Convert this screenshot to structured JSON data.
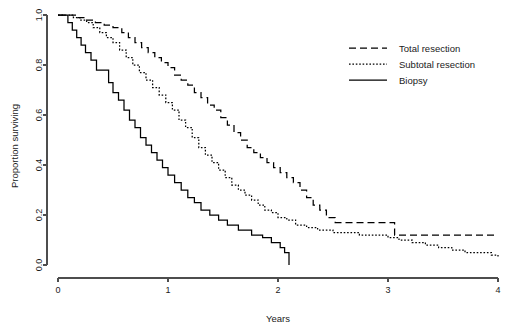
{
  "chart_data": {
    "type": "line",
    "title": "",
    "xlabel": "Years",
    "ylabel": "Proportion surviving",
    "xlim": [
      0,
      4
    ],
    "ylim": [
      0.0,
      1.0
    ],
    "xticks": [
      0,
      1,
      2,
      3,
      4
    ],
    "xtick_labels": [
      "0",
      "1",
      "2",
      "3",
      "4"
    ],
    "yticks": [
      0.0,
      0.2,
      0.4,
      0.6,
      0.8,
      1.0
    ],
    "ytick_labels": [
      "0.0",
      "0.2",
      "0.4",
      "0.6",
      "0.8",
      "1.0"
    ],
    "grid": false,
    "legend_position": "top-right",
    "step_type": "post",
    "series": [
      {
        "name": "Total resection",
        "line_style": "dashed",
        "color": "#000000",
        "dash_pattern": "7,4",
        "points": [
          [
            0.0,
            1.0
          ],
          [
            0.12,
            1.0
          ],
          [
            0.18,
            0.99
          ],
          [
            0.26,
            0.98
          ],
          [
            0.34,
            0.97
          ],
          [
            0.42,
            0.96
          ],
          [
            0.5,
            0.95
          ],
          [
            0.58,
            0.93
          ],
          [
            0.64,
            0.91
          ],
          [
            0.7,
            0.89
          ],
          [
            0.76,
            0.87
          ],
          [
            0.82,
            0.85
          ],
          [
            0.88,
            0.83
          ],
          [
            0.94,
            0.81
          ],
          [
            1.0,
            0.79
          ],
          [
            1.06,
            0.76
          ],
          [
            1.12,
            0.74
          ],
          [
            1.18,
            0.72
          ],
          [
            1.24,
            0.69
          ],
          [
            1.3,
            0.67
          ],
          [
            1.36,
            0.64
          ],
          [
            1.42,
            0.62
          ],
          [
            1.48,
            0.59
          ],
          [
            1.54,
            0.56
          ],
          [
            1.6,
            0.53
          ],
          [
            1.66,
            0.5
          ],
          [
            1.72,
            0.47
          ],
          [
            1.78,
            0.45
          ],
          [
            1.84,
            0.43
          ],
          [
            1.9,
            0.41
          ],
          [
            1.96,
            0.39
          ],
          [
            2.02,
            0.37
          ],
          [
            2.08,
            0.35
          ],
          [
            2.14,
            0.33
          ],
          [
            2.2,
            0.3
          ],
          [
            2.26,
            0.27
          ],
          [
            2.32,
            0.24
          ],
          [
            2.38,
            0.22
          ],
          [
            2.44,
            0.19
          ],
          [
            2.52,
            0.17
          ],
          [
            3.02,
            0.17
          ],
          [
            3.06,
            0.12
          ],
          [
            4.0,
            0.12
          ]
        ]
      },
      {
        "name": "Subtotal resection",
        "line_style": "dotted",
        "color": "#000000",
        "dash_pattern": "1.6,1.8",
        "points": [
          [
            0.0,
            1.0
          ],
          [
            0.08,
            1.0
          ],
          [
            0.14,
            0.99
          ],
          [
            0.2,
            0.98
          ],
          [
            0.26,
            0.97
          ],
          [
            0.32,
            0.95
          ],
          [
            0.38,
            0.93
          ],
          [
            0.44,
            0.91
          ],
          [
            0.5,
            0.89
          ],
          [
            0.56,
            0.86
          ],
          [
            0.62,
            0.83
          ],
          [
            0.68,
            0.8
          ],
          [
            0.74,
            0.77
          ],
          [
            0.8,
            0.74
          ],
          [
            0.86,
            0.71
          ],
          [
            0.92,
            0.68
          ],
          [
            0.98,
            0.65
          ],
          [
            1.04,
            0.62
          ],
          [
            1.1,
            0.58
          ],
          [
            1.16,
            0.55
          ],
          [
            1.22,
            0.51
          ],
          [
            1.28,
            0.47
          ],
          [
            1.34,
            0.44
          ],
          [
            1.4,
            0.41
          ],
          [
            1.46,
            0.38
          ],
          [
            1.52,
            0.35
          ],
          [
            1.58,
            0.32
          ],
          [
            1.64,
            0.3
          ],
          [
            1.7,
            0.28
          ],
          [
            1.76,
            0.26
          ],
          [
            1.82,
            0.24
          ],
          [
            1.88,
            0.22
          ],
          [
            1.94,
            0.21
          ],
          [
            2.0,
            0.19
          ],
          [
            2.08,
            0.18
          ],
          [
            2.16,
            0.16
          ],
          [
            2.26,
            0.15
          ],
          [
            2.36,
            0.14
          ],
          [
            2.5,
            0.13
          ],
          [
            2.62,
            0.13
          ],
          [
            2.74,
            0.12
          ],
          [
            2.88,
            0.12
          ],
          [
            3.0,
            0.11
          ],
          [
            3.1,
            0.1
          ],
          [
            3.22,
            0.09
          ],
          [
            3.34,
            0.08
          ],
          [
            3.46,
            0.07
          ],
          [
            3.58,
            0.06
          ],
          [
            3.7,
            0.05
          ],
          [
            3.84,
            0.05
          ],
          [
            3.94,
            0.04
          ],
          [
            4.0,
            0.03
          ]
        ]
      },
      {
        "name": "Biopsy",
        "line_style": "solid",
        "color": "#000000",
        "dash_pattern": "",
        "points": [
          [
            0.0,
            1.0
          ],
          [
            0.05,
            1.0
          ],
          [
            0.09,
            0.97
          ],
          [
            0.13,
            0.94
          ],
          [
            0.17,
            0.91
          ],
          [
            0.21,
            0.88
          ],
          [
            0.25,
            0.85
          ],
          [
            0.3,
            0.82
          ],
          [
            0.35,
            0.78
          ],
          [
            0.42,
            0.78
          ],
          [
            0.46,
            0.73
          ],
          [
            0.5,
            0.69
          ],
          [
            0.55,
            0.66
          ],
          [
            0.6,
            0.62
          ],
          [
            0.65,
            0.58
          ],
          [
            0.7,
            0.55
          ],
          [
            0.75,
            0.51
          ],
          [
            0.8,
            0.48
          ],
          [
            0.85,
            0.45
          ],
          [
            0.9,
            0.42
          ],
          [
            0.95,
            0.39
          ],
          [
            1.0,
            0.36
          ],
          [
            1.06,
            0.33
          ],
          [
            1.12,
            0.3
          ],
          [
            1.18,
            0.27
          ],
          [
            1.24,
            0.25
          ],
          [
            1.3,
            0.22
          ],
          [
            1.38,
            0.2
          ],
          [
            1.46,
            0.18
          ],
          [
            1.54,
            0.16
          ],
          [
            1.64,
            0.14
          ],
          [
            1.76,
            0.12
          ],
          [
            1.86,
            0.11
          ],
          [
            1.94,
            0.09
          ],
          [
            2.02,
            0.07
          ],
          [
            2.06,
            0.05
          ],
          [
            2.1,
            0.03
          ],
          [
            2.1,
            0.0
          ]
        ]
      }
    ]
  },
  "legend": {
    "items": [
      {
        "label": "Total resection",
        "style": "dashed"
      },
      {
        "label": "Subtotal resection",
        "style": "dotted"
      },
      {
        "label": "Biopsy",
        "style": "solid"
      }
    ]
  },
  "axes": {
    "x_title": "Years",
    "y_title": "Proportion surviving"
  }
}
